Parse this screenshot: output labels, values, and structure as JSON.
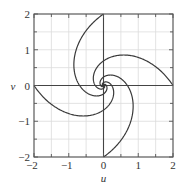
{
  "chart_data": {
    "type": "line",
    "title": "",
    "xlabel": "u",
    "ylabel": "v",
    "xlim": [
      -2,
      2
    ],
    "ylim": [
      -2,
      2
    ],
    "xticks": [
      -2,
      -1,
      0,
      1,
      2
    ],
    "yticks": [
      -2,
      -1,
      0,
      1,
      2
    ],
    "xtick_labels": [
      "−2",
      "−1",
      "0",
      "1",
      "2"
    ],
    "ytick_labels": [
      "−2",
      "−1",
      "0",
      "1",
      "2"
    ],
    "grid": true,
    "grid_step": 0.5,
    "legend": null,
    "series": [
      {
        "name": "spiral-from-(2,0)",
        "start": [
          2,
          0
        ],
        "theta0_deg": 0,
        "k": 0.68,
        "r0": 2,
        "sample_points": [
          [
            2,
            0
          ],
          [
            1.2,
            0.75
          ],
          [
            0.55,
            0.85
          ],
          [
            0,
            0.69
          ],
          [
            -0.3,
            0.35
          ],
          [
            -0.24,
            0
          ],
          [
            0,
            -0.16
          ],
          [
            0,
            0
          ]
        ]
      },
      {
        "name": "spiral-from-(0,2)",
        "start": [
          0,
          2
        ],
        "theta0_deg": 90,
        "k": 0.68,
        "r0": 2,
        "sample_points": [
          [
            0,
            2
          ],
          [
            -0.75,
            1.2
          ],
          [
            -0.85,
            0.55
          ],
          [
            -0.69,
            0
          ],
          [
            -0.35,
            -0.3
          ],
          [
            0,
            -0.24
          ],
          [
            0.16,
            0
          ],
          [
            0,
            0
          ]
        ]
      },
      {
        "name": "spiral-from-(-2,0)",
        "start": [
          -2,
          0
        ],
        "theta0_deg": 180,
        "k": 0.68,
        "r0": 2,
        "sample_points": [
          [
            -2,
            0
          ],
          [
            -1.2,
            -0.75
          ],
          [
            -0.55,
            -0.85
          ],
          [
            0,
            -0.69
          ],
          [
            0.3,
            -0.35
          ],
          [
            0.24,
            0
          ],
          [
            0,
            0.16
          ],
          [
            0,
            0
          ]
        ]
      },
      {
        "name": "spiral-from-(0,-2)",
        "start": [
          0,
          -2
        ],
        "theta0_deg": 270,
        "k": 0.68,
        "r0": 2,
        "sample_points": [
          [
            0,
            -2
          ],
          [
            0.75,
            -1.2
          ],
          [
            0.85,
            -0.55
          ],
          [
            0.69,
            0
          ],
          [
            0.35,
            0.3
          ],
          [
            0,
            0.24
          ],
          [
            -0.16,
            0
          ],
          [
            0,
            0
          ]
        ]
      }
    ],
    "colors": {
      "curve": "#3a3a3a",
      "frame": "#555555",
      "grid": "#dcdcdc",
      "axes": "#444444"
    }
  }
}
